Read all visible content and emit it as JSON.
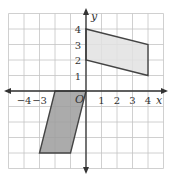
{
  "diagram": {
    "type": "coordinate-plane",
    "x_axis_label": "x",
    "y_axis_label": "y",
    "origin_label": "O",
    "x_tick_labels": [
      {
        "value": -4,
        "label": "−4"
      },
      {
        "value": -3,
        "label": "−3"
      },
      {
        "value": 1,
        "label": "1"
      },
      {
        "value": 2,
        "label": "2"
      },
      {
        "value": 3,
        "label": "3"
      },
      {
        "value": 4,
        "label": "4"
      }
    ],
    "y_tick_labels": [
      {
        "value": 1,
        "label": "1"
      },
      {
        "value": 2,
        "label": "2"
      },
      {
        "value": 3,
        "label": "3"
      },
      {
        "value": 4,
        "label": "4"
      }
    ],
    "grid": {
      "xmin": -5,
      "xmax": 5,
      "ymin": -5,
      "ymax": 5,
      "step": 1
    },
    "shapes": [
      {
        "name": "upper-parallelogram",
        "vertices": [
          [
            0,
            4
          ],
          [
            4,
            3
          ],
          [
            4,
            1
          ],
          [
            0,
            2
          ]
        ],
        "fill": "#e2e2e2"
      },
      {
        "name": "lower-parallelogram",
        "vertices": [
          [
            -2,
            0
          ],
          [
            0,
            0
          ],
          [
            -1,
            -4
          ],
          [
            -3,
            -4
          ]
        ],
        "fill": "#9c9c9c"
      }
    ],
    "colors": {
      "grid": "#c4c4c4",
      "axis": "#333333",
      "outline": "#444444"
    }
  }
}
